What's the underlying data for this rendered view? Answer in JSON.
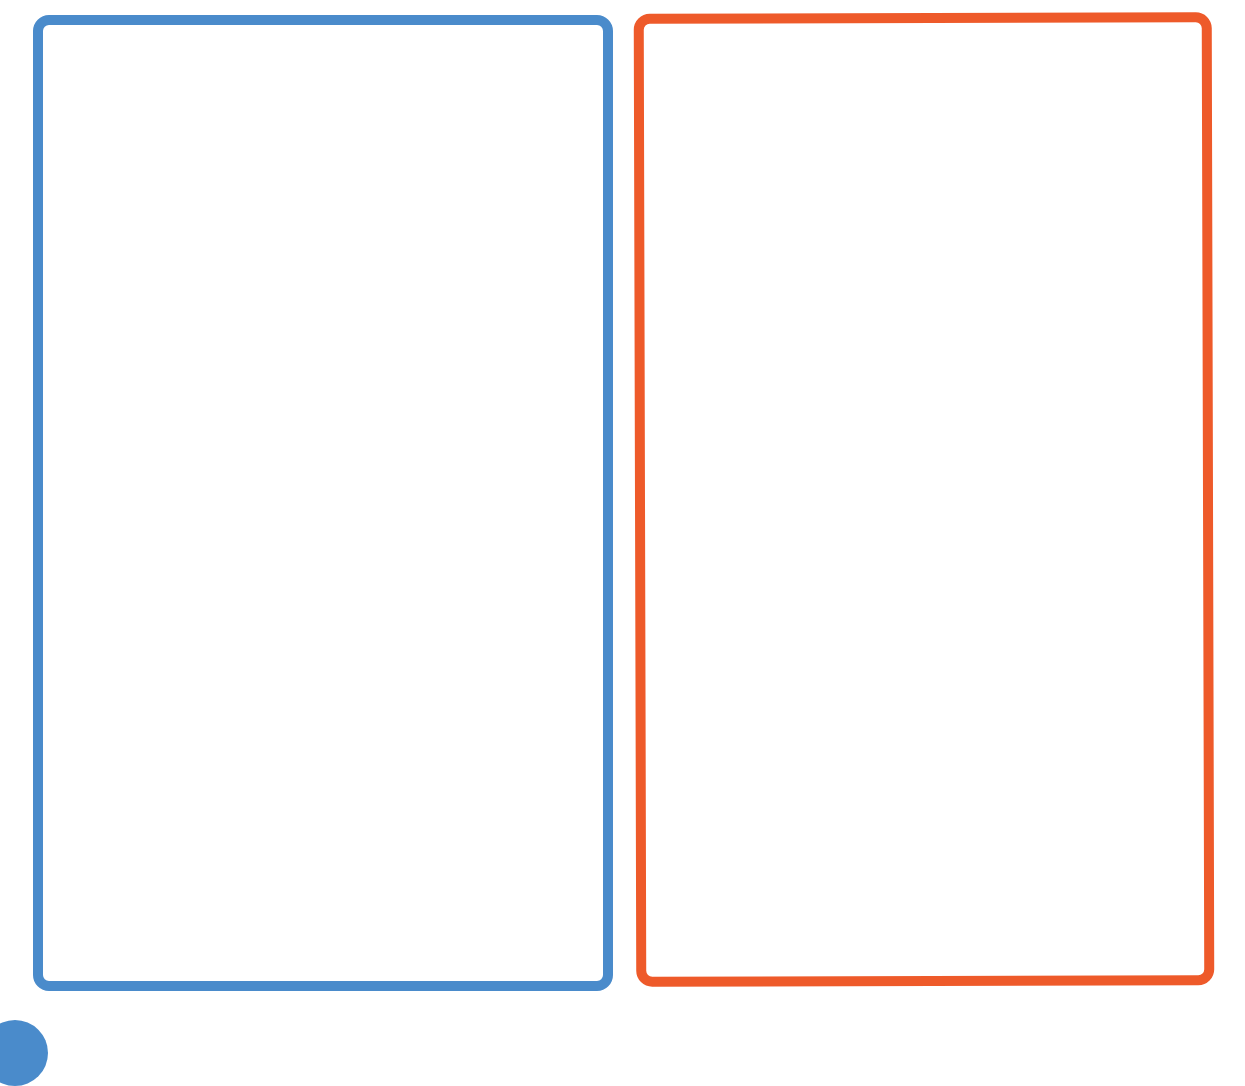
{
  "panels": [
    {
      "id": "left",
      "label": "",
      "border_color": "#4A8BCB",
      "content": ""
    },
    {
      "id": "right",
      "label": "",
      "border_color": "#EE5A2A",
      "content": ""
    }
  ],
  "corner_marker": {
    "shape": "circle",
    "color": "#4A8BCB"
  }
}
